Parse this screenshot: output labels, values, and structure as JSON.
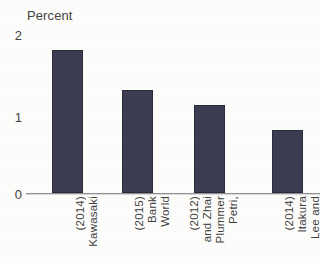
{
  "chart_data": {
    "type": "bar",
    "title": "Percent",
    "xlabel": "",
    "ylabel": "Percent",
    "ylim": [
      0,
      2
    ],
    "yticks": [
      "0",
      "1",
      "2"
    ],
    "grid": false,
    "legend": "none",
    "bar_color": "#3b3b52",
    "axis_color": "#8f8f93",
    "categories": [
      "Kawasaki (2014)",
      "World Bank (2015)",
      "Petri, Plummer and Zhai (2012)",
      "Lee and Itakura (2014)"
    ],
    "category_lines": [
      [
        "Kawasaki",
        "(2014)"
      ],
      [
        "World",
        "Bank",
        "(2015)"
      ],
      [
        "Petri,",
        "Plummer",
        "and Zhai",
        "(2012)"
      ],
      [
        "Lee and",
        "Itakura",
        "(2014)"
      ]
    ],
    "values": [
      1.74,
      1.26,
      1.07,
      0.77
    ]
  },
  "axis": {
    "tick_2": "2",
    "tick_1": "1",
    "tick_0": "0"
  },
  "labels": {
    "cat0_line0": "Kawasaki",
    "cat0_line1": "(2014)",
    "cat1_line0": "World",
    "cat1_line1": "Bank",
    "cat1_line2": "(2015)",
    "cat2_line0": "Petri,",
    "cat2_line1": "Plummer",
    "cat2_line2": "and Zhai",
    "cat2_line3": "(2012)",
    "cat3_line0": "Lee and",
    "cat3_line1": "Itakura",
    "cat3_line2": "(2014)"
  }
}
